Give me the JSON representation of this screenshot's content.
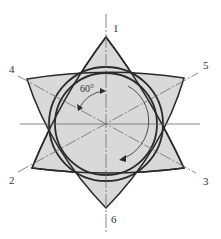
{
  "diagram": {
    "type": "six-point star with concentric circles (cam/rotor cross-section)",
    "labels": {
      "p1": "1",
      "p2": "2",
      "p3": "3",
      "p4": "4",
      "p5": "5",
      "p6": "6",
      "angle": "60°"
    },
    "colors": {
      "fill": "#d9d9d9",
      "stroke": "#2a2a2a",
      "axis": "#6a6a6a",
      "text": "#333333"
    }
  }
}
